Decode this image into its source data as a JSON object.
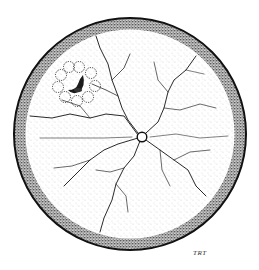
{
  "figure": {
    "style": "stippled ink drawing",
    "signature": "TRT",
    "colors": {
      "ink": "#111111",
      "stipple": "#444444",
      "vessel": "#333333",
      "background": "#ffffff"
    },
    "elements": {
      "outer_border": "circular-border",
      "periphery_band": "stippled-periphery",
      "optic_disc": "optic-disc",
      "vessels": "branching-retinal-vessels",
      "lesion": "pigmented-crescent-lesion-with-satellite-ring"
    }
  }
}
